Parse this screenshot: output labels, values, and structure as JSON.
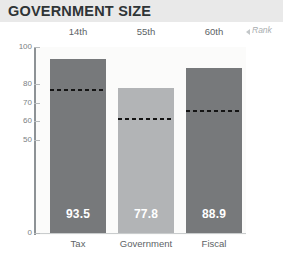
{
  "header": {
    "title": "GOVERNMENT SIZE",
    "band_color": "#e9e9e9",
    "title_color": "#2f3436"
  },
  "rank_row": {
    "note": "Rank",
    "arrow_icon": "triangle-left-icon",
    "values": [
      "14th",
      "55th",
      "60th"
    ]
  },
  "chart_data": {
    "type": "bar",
    "title": "GOVERNMENT SIZE",
    "xlabel": "",
    "ylabel": "",
    "ylim": [
      0,
      100
    ],
    "grid": false,
    "legend": "none",
    "categories": [
      "Tax",
      "Government",
      "Fiscal"
    ],
    "values": [
      93.5,
      77.8,
      88.9
    ],
    "value_labels": [
      "93.5",
      "77.8",
      "88.9"
    ],
    "ranks": [
      "14th",
      "55th",
      "60th"
    ],
    "reference_marks": [
      77.5,
      62.0,
      66.0
    ],
    "ytick_labels": [
      "100",
      "80",
      "70",
      "60",
      "50",
      "0"
    ],
    "ytick_values": [
      100,
      80,
      70,
      60,
      50,
      0
    ],
    "bar_colors": [
      "#77797b",
      "#b2b4b6",
      "#77797b"
    ],
    "reference_line_color": "#141414",
    "plot_background": "#fbfbfa"
  }
}
